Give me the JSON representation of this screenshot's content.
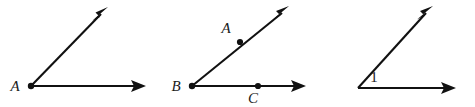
{
  "canvas": {
    "width": 475,
    "height": 107,
    "background_color": "#ffffff",
    "ink_color": "#111111"
  },
  "figures": [
    {
      "id": "figure-1",
      "description": "angle-with-single-vertex-label",
      "vertex_label": "A",
      "vertex": {
        "x": 31,
        "y": 86
      },
      "vertex_label_pos": {
        "x": 15,
        "y": 91
      },
      "rays": [
        {
          "name": "diagonal-ray",
          "tip": {
            "x": 108,
            "y": 7
          }
        },
        {
          "name": "horizontal-ray",
          "tip": {
            "x": 146,
            "y": 86
          }
        }
      ],
      "points": []
    },
    {
      "id": "figure-2",
      "description": "angle-with-three-labeled-points",
      "vertex_label": "B",
      "vertex": {
        "x": 192,
        "y": 86
      },
      "vertex_label_pos": {
        "x": 176,
        "y": 91
      },
      "rays": [
        {
          "name": "diagonal-ray",
          "tip": {
            "x": 289,
            "y": 6
          }
        },
        {
          "name": "horizontal-ray",
          "tip": {
            "x": 306,
            "y": 86
          }
        }
      ],
      "points": [
        {
          "label": "A",
          "x": 240,
          "y": 42,
          "label_pos": {
            "x": 226,
            "y": 33
          }
        },
        {
          "label": "C",
          "x": 258,
          "y": 86,
          "label_pos": {
            "x": 253,
            "y": 103
          }
        }
      ]
    },
    {
      "id": "figure-3",
      "description": "angle-with-number-label",
      "vertex_label": "",
      "vertex": {
        "x": 358,
        "y": 88
      },
      "angle_number": "1",
      "angle_number_pos": {
        "x": 371,
        "y": 82
      },
      "rays": [
        {
          "name": "diagonal-ray",
          "tip": {
            "x": 433,
            "y": 6
          }
        },
        {
          "name": "horizontal-ray",
          "tip": {
            "x": 456,
            "y": 88
          }
        }
      ],
      "points": []
    }
  ]
}
